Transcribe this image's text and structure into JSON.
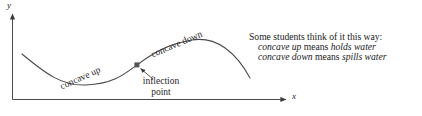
{
  "figure": {
    "background_color": "#ffffff",
    "ink_color": "#1f1f1f"
  },
  "axes": {
    "y_label": "y",
    "x_label": "x"
  },
  "curve": {
    "labels": {
      "concave_up": "concave up",
      "concave_down": "concave down"
    }
  },
  "annotation": {
    "inflection_line1": "inflection",
    "inflection_line2": "point"
  },
  "note": {
    "heading": "Some students think of it this way:",
    "line2": {
      "term": "concave up",
      "verb": "means",
      "result": "holds water"
    },
    "line3": {
      "term": "concave down",
      "verb": "means",
      "result": "spills water"
    }
  }
}
